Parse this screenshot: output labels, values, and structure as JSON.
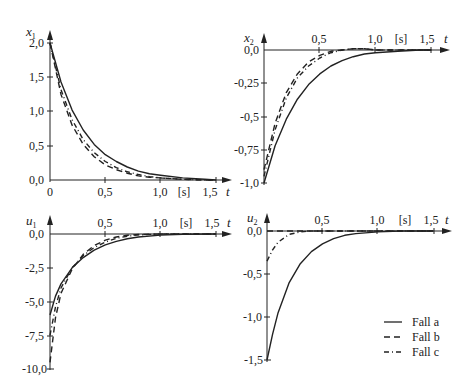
{
  "legend": [
    {
      "label": "Fall a",
      "style": "solid"
    },
    {
      "label": "Fall b",
      "style": "dashed"
    },
    {
      "label": "Fall c",
      "style": "dashdot"
    }
  ],
  "unit_label": "[s]",
  "chart_data": [
    {
      "type": "line",
      "ylabel": "x1",
      "xlabel": "t",
      "x_unit": "[s]",
      "xticks": [
        "0",
        "0,5",
        "1,0",
        "1,5"
      ],
      "yticks": [
        "2,0",
        "1,5",
        "1,0",
        "0,5",
        "0,0"
      ],
      "xlim": [
        0,
        1.6
      ],
      "ylim": [
        0,
        2.0
      ],
      "x": [
        0,
        0.1,
        0.2,
        0.3,
        0.4,
        0.5,
        0.6,
        0.7,
        0.8,
        0.9,
        1.0,
        1.2,
        1.4,
        1.5
      ],
      "series": [
        {
          "name": "Fall a",
          "values": [
            2.0,
            1.43,
            1.02,
            0.73,
            0.52,
            0.37,
            0.27,
            0.19,
            0.13,
            0.09,
            0.07,
            0.03,
            0.01,
            0.0
          ]
        },
        {
          "name": "Fall b",
          "values": [
            2.0,
            1.25,
            0.8,
            0.52,
            0.34,
            0.22,
            0.15,
            0.1,
            0.06,
            0.04,
            0.03,
            0.01,
            0.0,
            0.0
          ]
        },
        {
          "name": "Fall c",
          "values": [
            2.0,
            1.32,
            0.88,
            0.59,
            0.4,
            0.27,
            0.18,
            0.12,
            0.08,
            0.05,
            0.03,
            0.01,
            0.0,
            0.0
          ]
        }
      ]
    },
    {
      "type": "line",
      "ylabel": "x2",
      "xlabel": "t",
      "x_unit": "[s]",
      "xticks": [
        "0,5",
        "1,0",
        "1,5"
      ],
      "yticks": [
        "0,0",
        "-0,25",
        "-0,5",
        "-0,75",
        "-1,0"
      ],
      "xlim": [
        0,
        1.6
      ],
      "ylim": [
        -1.0,
        0.0
      ],
      "x": [
        0,
        0.1,
        0.2,
        0.3,
        0.4,
        0.5,
        0.6,
        0.7,
        0.8,
        0.9,
        1.0,
        1.2,
        1.4,
        1.5
      ],
      "series": [
        {
          "name": "Fall a",
          "values": [
            -1.0,
            -0.72,
            -0.52,
            -0.37,
            -0.26,
            -0.18,
            -0.12,
            -0.08,
            -0.05,
            -0.03,
            -0.02,
            -0.01,
            0.0,
            0.0
          ]
        },
        {
          "name": "Fall b",
          "values": [
            -0.9,
            -0.55,
            -0.32,
            -0.18,
            -0.09,
            -0.04,
            -0.01,
            0.0,
            0.01,
            0.01,
            0.0,
            0.0,
            0.0,
            0.0
          ]
        },
        {
          "name": "Fall c",
          "values": [
            -0.95,
            -0.6,
            -0.36,
            -0.21,
            -0.12,
            -0.06,
            -0.02,
            0.0,
            0.01,
            0.01,
            0.0,
            0.0,
            0.0,
            0.0
          ]
        }
      ]
    },
    {
      "type": "line",
      "ylabel": "u1",
      "xlabel": "t",
      "x_unit": "[s]",
      "xticks": [
        "0,5",
        "1,0",
        "1,5"
      ],
      "yticks": [
        "0,0",
        "-2,5",
        "-5,0",
        "-7,5",
        "-10,0"
      ],
      "xlim": [
        0,
        1.6
      ],
      "ylim": [
        -10.0,
        0.0
      ],
      "x": [
        0,
        0.05,
        0.1,
        0.2,
        0.3,
        0.4,
        0.5,
        0.6,
        0.7,
        0.8,
        1.0,
        1.2,
        1.5
      ],
      "series": [
        {
          "name": "Fall a",
          "values": [
            -6.0,
            -4.6,
            -3.7,
            -2.5,
            -1.75,
            -1.2,
            -0.8,
            -0.55,
            -0.35,
            -0.22,
            -0.08,
            -0.02,
            0.0
          ]
        },
        {
          "name": "Fall b",
          "values": [
            -9.5,
            -6.2,
            -4.4,
            -2.6,
            -1.5,
            -0.85,
            -0.45,
            -0.22,
            -0.1,
            -0.04,
            0.0,
            0.0,
            0.0
          ]
        },
        {
          "name": "Fall c",
          "values": [
            -7.5,
            -5.4,
            -4.0,
            -2.5,
            -1.6,
            -1.0,
            -0.6,
            -0.32,
            -0.16,
            -0.07,
            0.0,
            0.0,
            0.0
          ]
        }
      ]
    },
    {
      "type": "line",
      "ylabel": "u2",
      "xlabel": "t",
      "x_unit": "[s]",
      "xticks": [
        "0,5",
        "1,0",
        "1,5"
      ],
      "yticks": [
        "0,0",
        "-0,5",
        "-1,0",
        "-1,5"
      ],
      "xlim": [
        0,
        1.6
      ],
      "ylim": [
        -1.5,
        0.0
      ],
      "x": [
        0,
        0.05,
        0.1,
        0.2,
        0.3,
        0.4,
        0.5,
        0.6,
        0.7,
        0.8,
        1.0,
        1.2,
        1.5
      ],
      "series": [
        {
          "name": "Fall a",
          "values": [
            -1.5,
            -1.2,
            -0.95,
            -0.6,
            -0.38,
            -0.24,
            -0.15,
            -0.09,
            -0.05,
            -0.03,
            -0.01,
            0.0,
            0.0
          ]
        },
        {
          "name": "Fall b",
          "values": [
            0.0,
            0.0,
            0.0,
            0.0,
            0.0,
            0.0,
            0.0,
            0.0,
            0.0,
            0.0,
            0.0,
            0.0,
            0.0
          ]
        },
        {
          "name": "Fall c",
          "values": [
            -0.35,
            -0.22,
            -0.13,
            -0.04,
            -0.01,
            0.0,
            0.0,
            0.0,
            0.0,
            0.0,
            0.0,
            0.0,
            0.0
          ]
        }
      ]
    }
  ]
}
